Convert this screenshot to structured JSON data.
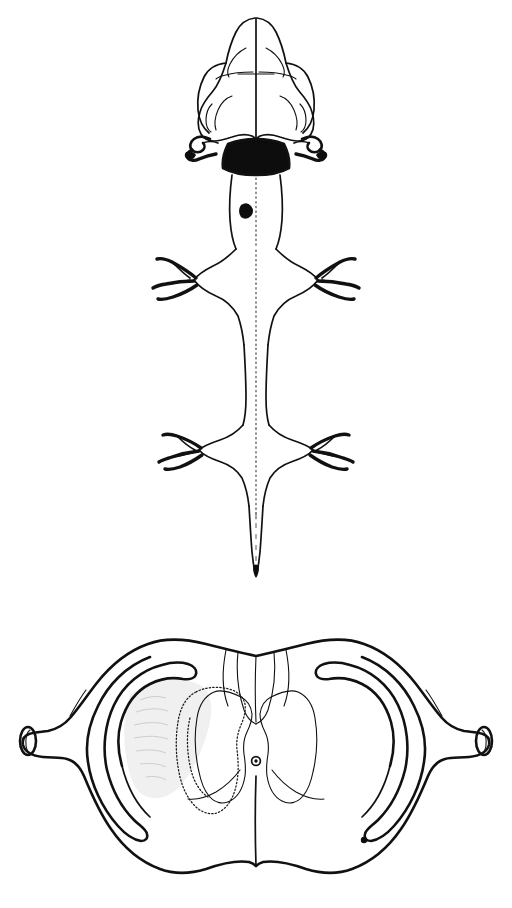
{
  "figure": {
    "background_color": "#ffffff",
    "ink_color": "#111111",
    "width": 512,
    "height": 908,
    "panel_count": 2,
    "type": "anatomical-line-drawing",
    "caption_top": "",
    "caption_bottom": ""
  },
  "panels": [
    {
      "id": "panel-dorsal",
      "name": "dorsal-view-central-nervous-system",
      "label": "",
      "structures": [
        {
          "name": "olfactory-bulbs",
          "label": ""
        },
        {
          "name": "cerebral-hemispheres",
          "label": ""
        },
        {
          "name": "interhemispheric-fissure",
          "label": ""
        },
        {
          "name": "cerebellum-hatched",
          "label": ""
        },
        {
          "name": "flocculus-left",
          "label": ""
        },
        {
          "name": "flocculus-right",
          "label": ""
        },
        {
          "name": "medulla-oblongata",
          "label": ""
        },
        {
          "name": "lesion-marker-brainstem",
          "label": ""
        },
        {
          "name": "cervical-enlargement",
          "label": ""
        },
        {
          "name": "cervical-nerve-roots-left",
          "label": ""
        },
        {
          "name": "cervical-nerve-roots-right",
          "label": ""
        },
        {
          "name": "thoracic-spinal-cord",
          "label": ""
        },
        {
          "name": "lumbar-enlargement",
          "label": ""
        },
        {
          "name": "lumbar-nerve-roots-left",
          "label": ""
        },
        {
          "name": "lumbar-nerve-roots-right",
          "label": ""
        },
        {
          "name": "conus-medullaris",
          "label": ""
        },
        {
          "name": "filum-terminale",
          "label": ""
        },
        {
          "name": "central-canal-dashed",
          "label": ""
        }
      ]
    },
    {
      "id": "panel-coronal",
      "name": "coronal-brain-section",
      "label": "",
      "structures": [
        {
          "name": "brain-outline",
          "label": ""
        },
        {
          "name": "lateral-ventricle-left",
          "label": ""
        },
        {
          "name": "lateral-ventricle-right",
          "label": ""
        },
        {
          "name": "optic-tract-stump-left",
          "label": ""
        },
        {
          "name": "optic-tract-stump-right",
          "label": ""
        },
        {
          "name": "thalamus-left",
          "label": ""
        },
        {
          "name": "thalamus-right",
          "label": ""
        },
        {
          "name": "third-ventricle",
          "label": ""
        },
        {
          "name": "midline-fissure",
          "label": ""
        },
        {
          "name": "stippled-injection-field",
          "label": ""
        },
        {
          "name": "lesion-marker-right-ventricle",
          "label": ""
        }
      ]
    }
  ],
  "markers": [
    {
      "name": "lesion-marker-brainstem",
      "shape": "filled-blob",
      "color": "#0d0d0d",
      "panel": "panel-dorsal"
    },
    {
      "name": "lesion-marker-right-ventricle",
      "shape": "filled-dot",
      "color": "#0d0d0d",
      "panel": "panel-coronal"
    }
  ],
  "colors": {
    "ink": "#111111",
    "solid_fill": "#0d0d0d",
    "stipple": "#1a1a1a",
    "faint_shade": "#c9c9c9",
    "background": "#ffffff"
  }
}
